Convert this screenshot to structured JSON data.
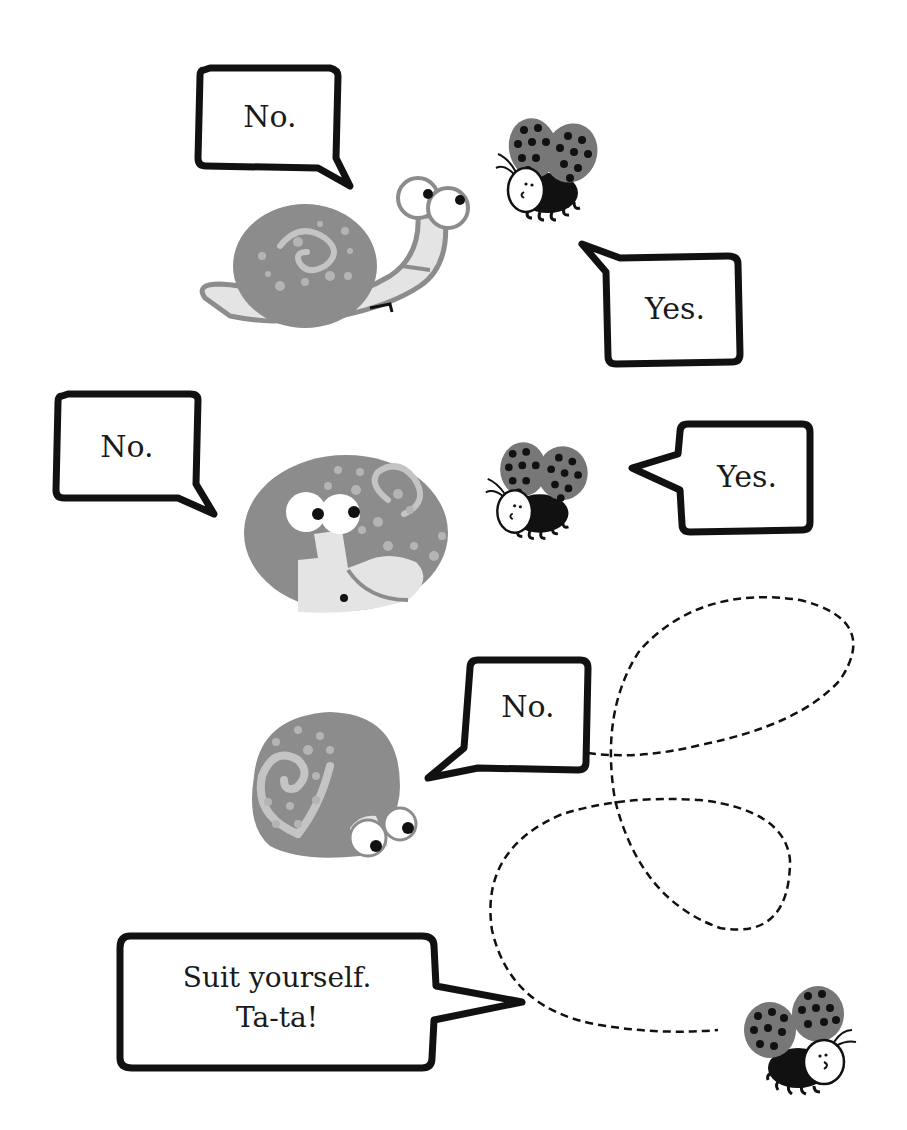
{
  "colors": {
    "background": "#ffffff",
    "ink": "#111111",
    "shell": "#8c8c8c",
    "shell_light": "#c4c4c4",
    "body_light": "#e4e4e4",
    "wing": "#7a7a7a"
  },
  "panels": [
    {
      "snail_bubble": {
        "text": "No."
      },
      "bee_bubble": {
        "text": "Yes."
      }
    },
    {
      "snail_bubble": {
        "text": "No."
      },
      "bee_bubble": {
        "text": "Yes."
      }
    },
    {
      "snail_bubble": {
        "text": "No."
      }
    },
    {
      "bee_bubble": {
        "line1": "Suit yourself.",
        "line2": "Ta-ta!"
      }
    }
  ],
  "characters": {
    "snail": "snail-icon",
    "bee": "ladybug-bee-icon",
    "flight_path": "dashed-flight-path"
  }
}
